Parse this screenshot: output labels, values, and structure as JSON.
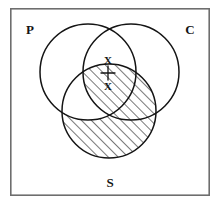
{
  "figure": {
    "background_color": "#ffffff",
    "stroke_color": "#141414",
    "frame_color": "#6e6e6e"
  },
  "frame": {
    "x": 10,
    "y": 8,
    "width": 200,
    "height": 188
  },
  "circles": [
    {
      "id": "P",
      "label": "P",
      "cx": 88,
      "cy": 72,
      "r": 48
    },
    {
      "id": "C",
      "label": "C",
      "cx": 131,
      "cy": 72,
      "r": 48
    },
    {
      "id": "S",
      "label": "S",
      "cx": 109,
      "cy": 111,
      "r": 47
    }
  ],
  "labels": {
    "p": {
      "text": "P",
      "x": 30,
      "y": 29
    },
    "c": {
      "text": "C",
      "x": 190,
      "y": 29
    },
    "s": {
      "text": "S",
      "x": 110,
      "y": 182
    }
  },
  "markers": [
    {
      "id": "x-upper",
      "text": "X",
      "x": 108,
      "y": 60,
      "region": "P and C only"
    },
    {
      "id": "x-lower",
      "text": "X",
      "x": 108,
      "y": 86,
      "region": "P and C and S"
    }
  ],
  "connector": {
    "x": 108,
    "y1": 66,
    "y2": 80,
    "cross_half_width": 7,
    "cross_y": 73
  },
  "shading": {
    "style": "diagonal-hatch",
    "angle_degrees": 45,
    "spacing": 7,
    "description": "S circle shaded except the part of S inside P and outside C"
  }
}
